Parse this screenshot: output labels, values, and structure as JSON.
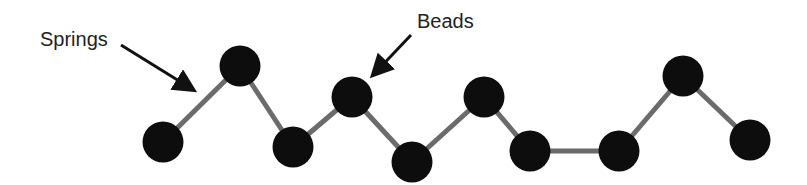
{
  "labels": {
    "springs": "Springs",
    "beads": "Beads"
  },
  "colors": {
    "bead": "#0d0d0d",
    "spring": "#6b6b6b",
    "arrow": "#111111",
    "text": "#222222"
  },
  "beads": [
    {
      "x": 163,
      "y": 142
    },
    {
      "x": 240,
      "y": 66
    },
    {
      "x": 293,
      "y": 147
    },
    {
      "x": 352,
      "y": 97
    },
    {
      "x": 412,
      "y": 162
    },
    {
      "x": 484,
      "y": 97
    },
    {
      "x": 530,
      "y": 151
    },
    {
      "x": 619,
      "y": 151
    },
    {
      "x": 683,
      "y": 76
    },
    {
      "x": 750,
      "y": 140
    }
  ]
}
